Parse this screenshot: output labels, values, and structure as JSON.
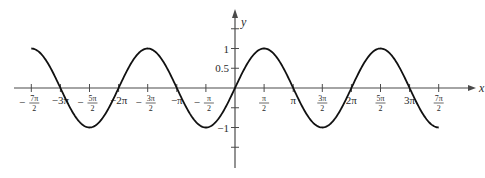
{
  "chart_data": {
    "type": "line",
    "title": "",
    "function": "y = sin(x)",
    "xlabel": "x",
    "ylabel": "y",
    "xlim": [
      -10.996,
      10.996
    ],
    "ylim": [
      -1.5,
      1.5
    ],
    "grid": false,
    "legend": null,
    "x_ticks": [
      {
        "value": -10.9956,
        "num": "7π",
        "den": "2",
        "sign": "−"
      },
      {
        "value": -9.4248,
        "label": "−3π"
      },
      {
        "value": -7.854,
        "num": "5π",
        "den": "2",
        "sign": "−"
      },
      {
        "value": -6.2832,
        "label": "−2π"
      },
      {
        "value": -4.7124,
        "num": "3π",
        "den": "2",
        "sign": "−"
      },
      {
        "value": -3.1416,
        "label": "−π"
      },
      {
        "value": -1.5708,
        "num": "π",
        "den": "2",
        "sign": "−"
      },
      {
        "value": 1.5708,
        "num": "π",
        "den": "2",
        "sign": ""
      },
      {
        "value": 3.1416,
        "label": "π"
      },
      {
        "value": 4.7124,
        "num": "3π",
        "den": "2",
        "sign": ""
      },
      {
        "value": 6.2832,
        "label": "2π"
      },
      {
        "value": 7.854,
        "num": "5π",
        "den": "2",
        "sign": ""
      },
      {
        "value": 9.4248,
        "label": "3π"
      },
      {
        "value": 10.9956,
        "num": "7π",
        "den": "2",
        "sign": ""
      }
    ],
    "y_ticks": [
      {
        "value": 1.5,
        "label": ""
      },
      {
        "value": 1,
        "label": "1"
      },
      {
        "value": 0.5,
        "label": "0.5"
      },
      {
        "value": -0.5,
        "label": ""
      },
      {
        "value": -1,
        "label": "−1"
      },
      {
        "value": -1.5,
        "label": ""
      }
    ],
    "series": [
      {
        "name": "sin(x)",
        "x": [
          -10.9956,
          -9.4248,
          -7.854,
          -6.2832,
          -4.7124,
          -3.1416,
          -1.5708,
          0,
          1.5708,
          3.1416,
          4.7124,
          6.2832,
          7.854,
          9.4248,
          10.9956
        ],
        "values": [
          1,
          0,
          -1,
          0,
          1,
          0,
          -1,
          0,
          1,
          0,
          -1,
          0,
          1,
          0,
          -1
        ]
      }
    ]
  },
  "colors": {
    "axis": "#4a4a4a",
    "curve": "#111111",
    "text": "#2a2a2a"
  }
}
